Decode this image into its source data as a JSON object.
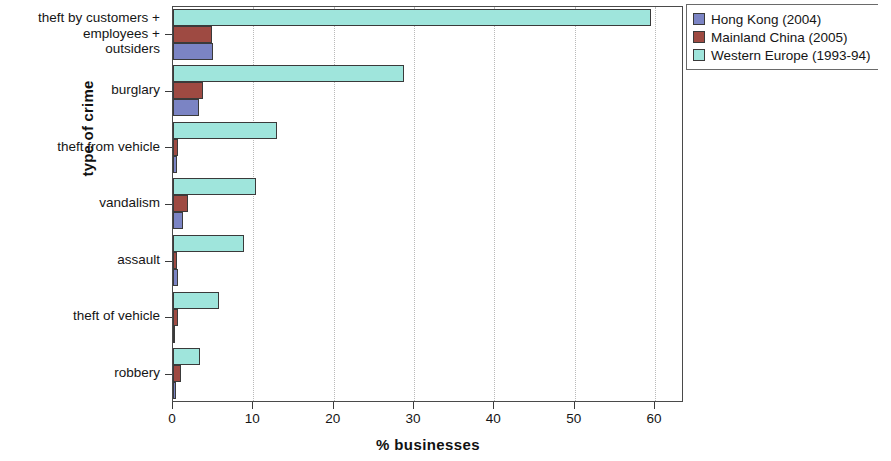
{
  "chart_data": {
    "type": "bar",
    "orientation": "horizontal",
    "title": "",
    "xlabel": "% businesses",
    "ylabel": "type of crime",
    "xlim": [
      0,
      63.6
    ],
    "xticks": [
      0,
      10,
      20,
      30,
      40,
      50,
      60
    ],
    "xtick_labels": [
      "0",
      "10",
      "20",
      "30",
      "40",
      "50",
      "60"
    ],
    "grid": "vertical dotted gridlines at x ticks",
    "legend_position": "upper right, outside plot area",
    "categories": [
      "theft by customers +\nemployees +\noutsiders",
      "burglary",
      "theft from vehicle",
      "vandalism",
      "assault",
      "theft of vehicle",
      "robbery"
    ],
    "series": [
      {
        "name": "Hong Kong (2004)",
        "color": "#7b84c4",
        "values": [
          5.0,
          3.2,
          0.5,
          1.2,
          0.6,
          0.3,
          0.4
        ]
      },
      {
        "name": "Mainland China (2005)",
        "color": "#9e4a42",
        "values": [
          4.8,
          3.7,
          0.6,
          1.9,
          0.5,
          0.6,
          1.0
        ]
      },
      {
        "name": "Western Europe (1993-94)",
        "color": "#9fe5dc",
        "values": [
          59.5,
          28.8,
          13.0,
          10.3,
          8.8,
          5.7,
          3.4
        ]
      }
    ]
  },
  "legend": {
    "entries": [
      {
        "label": "Hong Kong (2004)"
      },
      {
        "label": "Mainland China (2005)"
      },
      {
        "label": "Western Europe (1993-94)"
      }
    ]
  },
  "axes": {
    "x_title": "% businesses",
    "y_title": "type of crime"
  }
}
